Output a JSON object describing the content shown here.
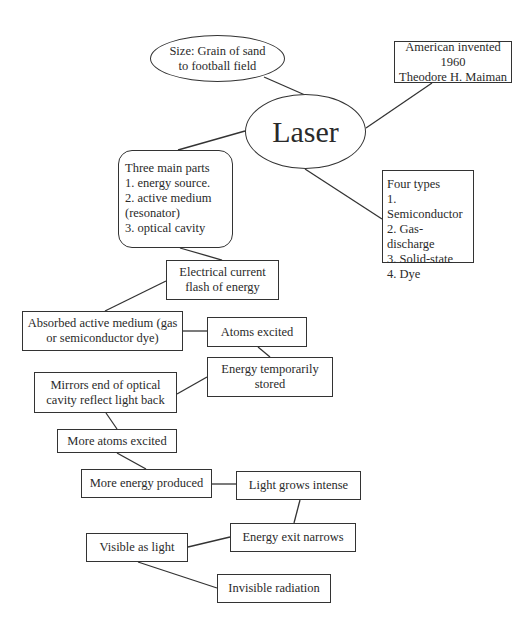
{
  "diagram": {
    "type": "concept-map",
    "central": "Laser",
    "nodes": {
      "size": "Size: Grain of sand\nto football field",
      "laser": "Laser",
      "invented": "American invented 1960\nTheodore H. Maiman",
      "parts": "Three main parts\n1. energy source.\n2. active medium\n(resonator)\n3. optical cavity",
      "types": "Four types\n1. Semiconductor\n2. Gas-discharge\n3. Solid-state\n4. Dye",
      "electrical": "Electrical current\nflash of energy",
      "absorbed": "Absorbed active medium (gas\nor semiconductor dye)",
      "atoms_excited": "Atoms excited",
      "energy_stored": "Energy temporarily\nstored",
      "mirrors": "Mirrors end of optical\ncavity reflect light back",
      "more_atoms": "More atoms excited",
      "more_energy": "More energy produced",
      "light_intense": "Light grows intense",
      "exit_narrows": "Energy exit narrows",
      "visible": "Visible as light",
      "invisible": "Invisible radiation"
    },
    "edges": [
      [
        "size",
        "laser"
      ],
      [
        "invented",
        "laser"
      ],
      [
        "laser",
        "parts"
      ],
      [
        "laser",
        "types"
      ],
      [
        "parts",
        "electrical"
      ],
      [
        "electrical",
        "absorbed"
      ],
      [
        "absorbed",
        "atoms_excited"
      ],
      [
        "atoms_excited",
        "energy_stored"
      ],
      [
        "energy_stored",
        "mirrors"
      ],
      [
        "mirrors",
        "more_atoms"
      ],
      [
        "more_atoms",
        "more_energy"
      ],
      [
        "more_energy",
        "light_intense"
      ],
      [
        "light_intense",
        "exit_narrows"
      ],
      [
        "exit_narrows",
        "visible"
      ],
      [
        "visible",
        "invisible"
      ]
    ],
    "colors": {
      "line": "#333333",
      "text": "#2a2a2a",
      "background": "#ffffff"
    }
  }
}
